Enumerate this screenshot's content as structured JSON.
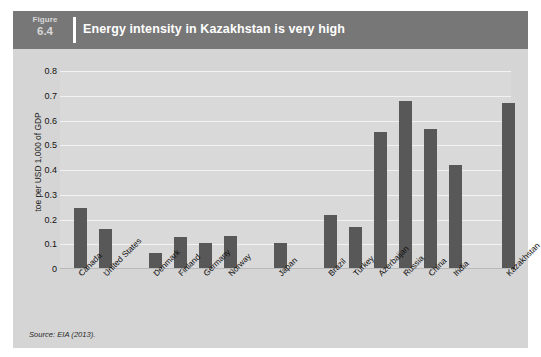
{
  "figure": {
    "label_word": "Figure",
    "label_number": "6.4",
    "title": "Energy intensity in Kazakhstan is very high",
    "source": "Source: EIA (2013).",
    "header_color": "#777777",
    "card_color": "#d5d5d5",
    "plot_background": "#d9d9d9",
    "bar_color": "#585858",
    "gridline_color": "#f2f2f2"
  },
  "chart_data": {
    "type": "bar",
    "title": "Energy intensity in Kazakhstan is very high",
    "xlabel": "",
    "ylabel": "toe per USD 1,000 of GDP",
    "ylim": [
      0,
      0.8
    ],
    "ytick_labels": [
      "0.8",
      "0.7",
      "0.6",
      "0.5",
      "0.4",
      "0.3",
      "0.2",
      "0.1",
      "0"
    ],
    "ytick_values": [
      0.8,
      0.7,
      0.6,
      0.5,
      0.4,
      0.3,
      0.2,
      0.1,
      0
    ],
    "grid": true,
    "legend": "none",
    "categories": [
      "Canada",
      "United States",
      "Denmark",
      "Finland",
      "Germany",
      "Norway",
      "Japan",
      "Brazil",
      "Turkey",
      "Azerbaijan",
      "Russia",
      "China",
      "India",
      "Kazakhstan"
    ],
    "values": [
      0.245,
      0.16,
      0.065,
      0.13,
      0.105,
      0.135,
      0.105,
      0.22,
      0.17,
      0.555,
      0.68,
      0.565,
      0.42,
      0.67
    ],
    "group_breaks_after": [
      "United States",
      "Norway",
      "Japan"
    ],
    "source": "Source: EIA (2013)."
  }
}
